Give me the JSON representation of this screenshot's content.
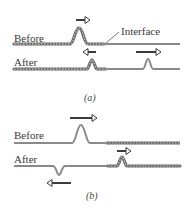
{
  "figure": {
    "part_a": {
      "caption": "(a)",
      "before_label": "Before",
      "after_label": "After",
      "interface_label": "Interface",
      "left_medium": "thick rope (dense)",
      "right_medium": "thin rope (light)",
      "incident_pulse": "upright, moving right",
      "reflected_pulse": "upright, smaller, moving left",
      "transmitted_pulse": "upright, moving right (faster)"
    },
    "part_b": {
      "caption": "(b)",
      "before_label": "Before",
      "after_label": "After",
      "left_medium": "thin rope (light)",
      "right_medium": "thick rope (dense)",
      "incident_pulse": "upright, moving right",
      "reflected_pulse": "inverted, moving left",
      "transmitted_pulse": "upright, smaller, moving right (slower)"
    },
    "colors": {
      "rope": "#8a8a8a",
      "rope_dark": "#5a5a5a",
      "arrow": "#3c3c3c",
      "text": "#3a3a3a"
    }
  }
}
